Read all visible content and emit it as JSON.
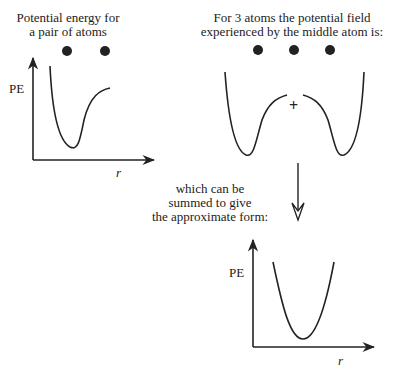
{
  "panel_pair": {
    "title_line1": "Potential energy for",
    "title_line2": "a pair of atoms",
    "y_label": "PE",
    "x_label": "r",
    "atom_count": 2
  },
  "panel_triple": {
    "title_line1": "For 3 atoms the potential field",
    "title_line2": "experienced by the middle atom is:",
    "center_marker": "+",
    "atom_count": 3
  },
  "arrow_caption": {
    "line1": "which can be",
    "line2": "summed to give",
    "line3": "the approximate form:"
  },
  "panel_sum": {
    "y_label": "PE",
    "x_label": "r"
  },
  "colors": {
    "ink": "#222222",
    "background": "#ffffff"
  }
}
